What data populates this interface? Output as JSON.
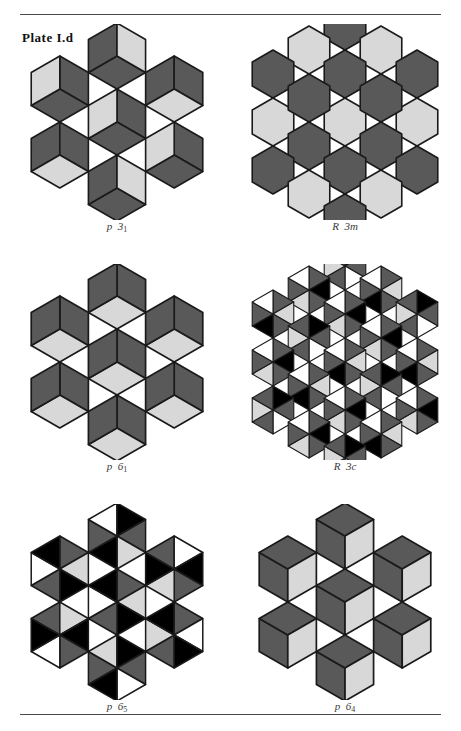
{
  "plate": {
    "label": "Plate I.d"
  },
  "colors": {
    "dark": "#595959",
    "light": "#d8d8d8",
    "black": "#000000",
    "white": "#ffffff",
    "outline": "#1a1a1a",
    "rule": "#4a4a4a",
    "page_background": "#ffffff",
    "caption_text": "#3a3a3a"
  },
  "figures": [
    {
      "id": "fig-p31",
      "caption_prefix": "p",
      "caption_group": "3",
      "caption_subscript": "1",
      "caption_full": "p 3₁",
      "pattern": "hexagons-split-three-pentagons",
      "description": "Seven hexagons, each divided into three pentagonal regions; two dark, one light",
      "tile_count": 7
    },
    {
      "id": "fig-R3m",
      "caption_prefix": "R",
      "caption_group": "3",
      "caption_subscript": "m",
      "caption_full": "R 3m",
      "pattern": "plain-hexagon-tiling",
      "description": "Nineteen plain hexagons alternating dark gray and light gray",
      "tile_count": 19
    },
    {
      "id": "fig-p61",
      "caption_prefix": "p",
      "caption_group": "6",
      "caption_subscript": "1",
      "caption_full": "p 6₁",
      "pattern": "rhombic-cube-tiling",
      "description": "Rhombille tiling of 60-degree rhombi, two dark orientations and one light",
      "tile_count": 24
    },
    {
      "id": "fig-R3c",
      "caption_prefix": "R",
      "caption_group": "3",
      "caption_subscript": "c",
      "caption_full": "R 3c",
      "pattern": "hexagons-six-triangles",
      "description": "Hexagons each split into six triangles coloured black, white, dark gray and light gray",
      "tile_count": 19
    },
    {
      "id": "fig-p65",
      "caption_prefix": "p",
      "caption_group": "6",
      "caption_subscript": "5",
      "caption_full": "p 6₅",
      "pattern": "hexagons-quartered-high-contrast",
      "description": "Hexagons quartered into black, white, dark gray and light gray wedges",
      "tile_count": 7
    },
    {
      "id": "fig-p64",
      "caption_prefix": "p",
      "caption_group": "6",
      "caption_subscript": "4",
      "caption_full": "p 6₄",
      "pattern": "rhombic-star-tiling",
      "description": "Rhombille star tiling with dark rhombi surrounding light rhombi",
      "tile_count": 24
    }
  ]
}
